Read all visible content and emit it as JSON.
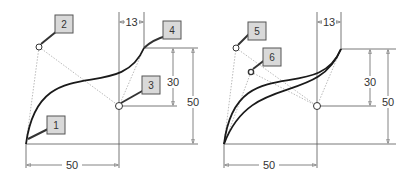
{
  "diagrams": [
    {
      "id": "left",
      "description": "Cubic spline with start, two control points and end point",
      "callouts": [
        {
          "label": "1",
          "target": "start-point"
        },
        {
          "label": "2",
          "target": "first-control-point"
        },
        {
          "label": "3",
          "target": "second-control-point"
        },
        {
          "label": "4",
          "target": "end-point"
        }
      ],
      "dimensions": {
        "horizontal_bottom": "50",
        "horizontal_top": "13",
        "vertical_inner": "30",
        "vertical_outer": "50"
      }
    },
    {
      "id": "right",
      "description": "Two spline variants comparing control point positions",
      "callouts": [
        {
          "label": "5",
          "target": "first-control-point-a"
        },
        {
          "label": "6",
          "target": "first-control-point-b"
        }
      ],
      "dimensions": {
        "horizontal_bottom": "50",
        "horizontal_top": "13",
        "vertical_inner": "30",
        "vertical_outer": "50"
      }
    }
  ],
  "colors": {
    "curve": "#1a1a1a",
    "construction": "#9a9a9a",
    "dimension": "#555555",
    "callout_fill": "#d9d9d9",
    "callout_border": "#555555"
  }
}
